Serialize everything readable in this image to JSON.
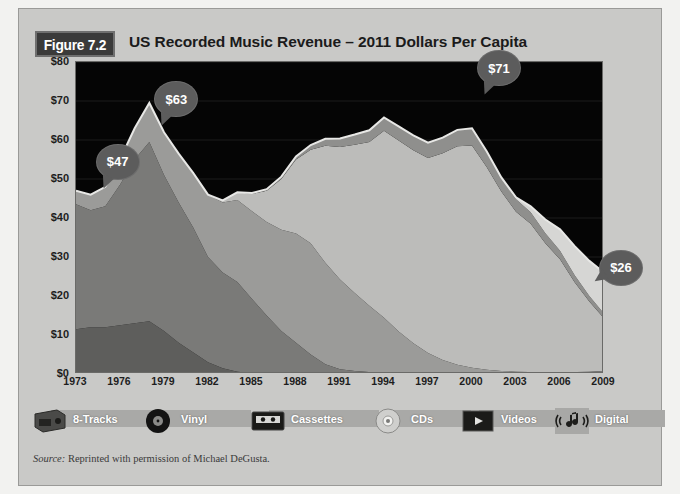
{
  "figure": {
    "badge": "Figure 7.2",
    "title": "US Recorded Music Revenue – 2011 Dollars Per Capita",
    "source_prefix": "Source:",
    "source_text": " Reprinted with permission of Michael DeGusta."
  },
  "colors": {
    "plot_background": "#050505",
    "card_background": "#c9c9c7",
    "badge_background": "#3a3a3a",
    "callout_background": "#5c5c5c",
    "eight_tracks": "#5e5e5c",
    "vinyl": "#7a7a78",
    "cassettes": "#9b9b99",
    "cds": "#bcbcba",
    "videos": "#8f8f8d",
    "digital": "#d6d6d4",
    "gridline": "#1d1d1d",
    "axis_text": "#1d1d1d"
  },
  "legend": {
    "items": [
      {
        "label": "8-Tracks",
        "icon": "eight-track-cartridge-icon",
        "color": "#5e5e5c"
      },
      {
        "label": "Vinyl",
        "icon": "vinyl-record-icon",
        "color": "#7a7a78"
      },
      {
        "label": "Cassettes",
        "icon": "cassette-tape-icon",
        "color": "#9b9b99"
      },
      {
        "label": "CDs",
        "icon": "compact-disc-icon",
        "color": "#bcbcba"
      },
      {
        "label": "Videos",
        "icon": "video-screen-icon",
        "color": "#8f8f8d"
      },
      {
        "label": "Digital",
        "icon": "music-note-waves-icon",
        "color": "#d6d6d4"
      }
    ]
  },
  "callouts": [
    {
      "label": "$47",
      "x": 1974,
      "y": 47,
      "tail": "tail-bl"
    },
    {
      "label": "$63",
      "x": 1978,
      "y": 63,
      "tail": "tail-bl"
    },
    {
      "label": "$71",
      "x": 2000,
      "y": 71,
      "tail": "tail-bl"
    },
    {
      "label": "$26",
      "x": 2009,
      "y": 26,
      "tail": "tail-l"
    }
  ],
  "chart_data": {
    "type": "area",
    "stacked": true,
    "title": "US Recorded Music Revenue – 2011 Dollars Per Capita",
    "xlabel": "",
    "ylabel": "2011 Dollars Per Capita",
    "xlim": [
      1973,
      2009
    ],
    "ylim": [
      0,
      80
    ],
    "ytick_labels": [
      "$0",
      "$10",
      "$20",
      "$30",
      "$40",
      "$50",
      "$60",
      "$70",
      "$80"
    ],
    "ytick_values": [
      0,
      10,
      20,
      30,
      40,
      50,
      60,
      70,
      80
    ],
    "xtick_labels": [
      "1973",
      "1976",
      "1979",
      "1982",
      "1985",
      "1988",
      "1991",
      "1994",
      "1997",
      "2000",
      "2003",
      "2006",
      "2009"
    ],
    "xtick_values": [
      1973,
      1976,
      1979,
      1982,
      1985,
      1988,
      1991,
      1994,
      1997,
      2000,
      2003,
      2006,
      2009
    ],
    "grid": true,
    "legend_position": "bottom",
    "x": [
      1973,
      1974,
      1975,
      1976,
      1977,
      1978,
      1979,
      1980,
      1981,
      1982,
      1983,
      1984,
      1985,
      1986,
      1987,
      1988,
      1989,
      1990,
      1991,
      1992,
      1993,
      1994,
      1995,
      1996,
      1997,
      1998,
      1999,
      2000,
      2001,
      2002,
      2003,
      2004,
      2005,
      2006,
      2007,
      2008,
      2009
    ],
    "series": [
      {
        "name": "8-Tracks",
        "color": "#5e5e5c",
        "values": [
          11.5,
          12.0,
          12.0,
          12.5,
          13.0,
          13.5,
          11.0,
          8.0,
          5.5,
          3.0,
          1.5,
          0.6,
          0.2,
          0.0,
          0.0,
          0.0,
          0.0,
          0.0,
          0.0,
          0.0,
          0.0,
          0.0,
          0.0,
          0.0,
          0.0,
          0.0,
          0.0,
          0.0,
          0.0,
          0.0,
          0.0,
          0.0,
          0.0,
          0.0,
          0.0,
          0.0,
          0.0
        ]
      },
      {
        "name": "Vinyl",
        "color": "#7a7a78",
        "values": [
          32.0,
          30.0,
          31.0,
          36.0,
          42.0,
          46.0,
          40.0,
          36.0,
          32.0,
          27.0,
          24.5,
          23.0,
          19.0,
          15.0,
          11.0,
          8.0,
          5.0,
          2.5,
          1.2,
          0.8,
          0.5,
          0.4,
          0.4,
          0.4,
          0.4,
          0.4,
          0.4,
          0.4,
          0.4,
          0.4,
          0.4,
          0.4,
          0.4,
          0.4,
          0.5,
          0.6,
          0.8
        ]
      },
      {
        "name": "Cassettes",
        "color": "#9b9b99",
        "values": [
          3.5,
          4.0,
          5.0,
          6.5,
          8.0,
          10.0,
          11.0,
          12.5,
          14.0,
          16.0,
          18.0,
          21.0,
          22.5,
          24.0,
          26.0,
          28.0,
          28.5,
          26.0,
          23.0,
          20.0,
          17.0,
          14.0,
          10.5,
          7.5,
          5.0,
          3.2,
          2.0,
          1.2,
          0.7,
          0.4,
          0.2,
          0.1,
          0.1,
          0.0,
          0.0,
          0.0,
          0.0
        ]
      },
      {
        "name": "CDs",
        "color": "#bcbcba",
        "values": [
          0.0,
          0.0,
          0.0,
          0.0,
          0.0,
          0.0,
          0.0,
          0.0,
          0.0,
          0.0,
          0.5,
          2.0,
          4.5,
          8.0,
          13.0,
          19.0,
          24.0,
          30.0,
          34.0,
          38.0,
          42.0,
          48.0,
          49.0,
          49.5,
          50.0,
          53.0,
          56.0,
          57.0,
          52.0,
          46.0,
          41.0,
          38.0,
          33.0,
          29.0,
          23.0,
          18.0,
          13.5
        ]
      },
      {
        "name": "Videos",
        "color": "#8f8f8d",
        "values": [
          0.0,
          0.0,
          0.0,
          0.0,
          0.0,
          0.0,
          0.0,
          0.0,
          0.0,
          0.0,
          0.0,
          0.0,
          0.2,
          0.4,
          0.6,
          0.8,
          1.2,
          1.8,
          2.2,
          2.6,
          3.0,
          3.4,
          3.6,
          3.8,
          3.9,
          4.0,
          4.2,
          4.4,
          4.0,
          3.6,
          3.2,
          3.0,
          2.6,
          2.2,
          1.8,
          1.4,
          1.2
        ]
      },
      {
        "name": "Digital",
        "color": "#d6d6d4",
        "values": [
          0.0,
          0.0,
          0.0,
          0.0,
          0.0,
          0.0,
          0.0,
          0.0,
          0.0,
          0.0,
          0.0,
          0.0,
          0.0,
          0.0,
          0.0,
          0.0,
          0.0,
          0.0,
          0.0,
          0.0,
          0.0,
          0.0,
          0.0,
          0.0,
          0.0,
          0.0,
          0.0,
          0.0,
          0.0,
          0.0,
          0.5,
          1.5,
          3.5,
          5.5,
          7.5,
          9.0,
          10.5
        ]
      }
    ],
    "annotations": [
      {
        "label": "$47",
        "x": 1974,
        "y": 47
      },
      {
        "label": "$63",
        "x": 1978,
        "y": 63
      },
      {
        "label": "$71",
        "x": 2000,
        "y": 71
      },
      {
        "label": "$26",
        "x": 2009,
        "y": 26
      }
    ]
  }
}
